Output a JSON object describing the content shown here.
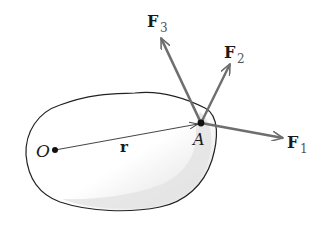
{
  "diagram": {
    "type": "rigid-body-forces",
    "body": {
      "fill_color": "#e6e6e6",
      "outline_color": "#222222"
    },
    "points": {
      "origin": {
        "label": "O"
      },
      "point_a": {
        "label": "A"
      }
    },
    "position_vector": {
      "label": "r",
      "from": "O",
      "to": "A",
      "color": "#333333"
    },
    "forces": [
      {
        "name": "F",
        "subscript": "1",
        "applied_at": "A",
        "color": "#6e6e6e"
      },
      {
        "name": "F",
        "subscript": "2",
        "applied_at": "A",
        "color": "#6e6e6e"
      },
      {
        "name": "F",
        "subscript": "3",
        "applied_at": "A",
        "color": "#6e6e6e"
      }
    ]
  }
}
